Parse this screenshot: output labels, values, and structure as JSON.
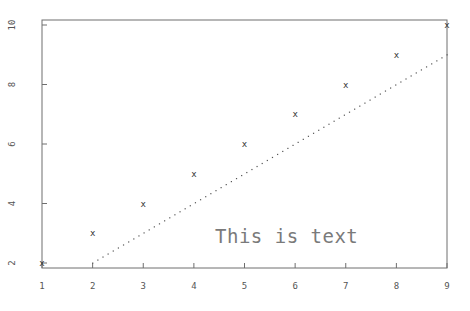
{
  "chart_data": {
    "type": "scatter",
    "title": "",
    "xlabel": "",
    "ylabel": "",
    "xlim": [
      1,
      9
    ],
    "ylim": [
      2,
      10
    ],
    "grid": false,
    "x_ticks": [
      "1",
      "2",
      "3",
      "4",
      "5",
      "6",
      "7",
      "8",
      "9"
    ],
    "y_ticks": [
      "2",
      "4",
      "6",
      "8",
      "10"
    ],
    "series": [
      {
        "name": "points",
        "marker": "x",
        "x": [
          1,
          2,
          3,
          4,
          5,
          6,
          7,
          8,
          9
        ],
        "y": [
          2,
          3,
          4,
          5,
          6,
          7,
          8,
          9,
          10
        ]
      },
      {
        "name": "line",
        "style": "dotted",
        "x": [
          2,
          9
        ],
        "y": [
          2,
          9
        ]
      }
    ],
    "annotations": [
      {
        "text": "This is text",
        "x": 5.2,
        "y": 3.1
      }
    ]
  },
  "annotation_text": "This is text",
  "point_marker": "x"
}
